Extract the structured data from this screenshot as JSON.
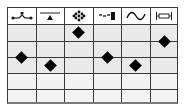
{
  "columns": [
    {
      "icon": "valve-symbol-icon"
    },
    {
      "icon": "triangle-on-line-icon"
    },
    {
      "icon": "dots-cluster-icon"
    },
    {
      "icon": "dashes-block-icon"
    },
    {
      "icon": "sine-wave-icon"
    },
    {
      "icon": "bracket-box-icon"
    }
  ],
  "rows": [
    {
      "shade": "a"
    },
    {
      "shade": "a"
    },
    {
      "shade": "a"
    },
    {
      "shade": "b"
    },
    {
      "shade": "b"
    }
  ],
  "markers": [
    {
      "column": 1,
      "level": 2.0
    },
    {
      "column": 2,
      "level": 2.5
    },
    {
      "column": 3,
      "level": 0.5
    },
    {
      "column": 4,
      "level": 2.0
    },
    {
      "column": 5,
      "level": 2.5
    },
    {
      "column": 6,
      "level": 1.0
    }
  ],
  "colors": {
    "marker": "#000000",
    "grid": "#3a3a3a"
  }
}
